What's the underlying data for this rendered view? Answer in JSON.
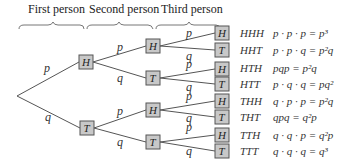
{
  "headers": [
    {
      "label": "First person"
    },
    {
      "label": "Second person"
    },
    {
      "label": "Third person"
    }
  ],
  "level1": [
    {
      "node": "H",
      "edge": "p"
    },
    {
      "node": "T",
      "edge": "q"
    }
  ],
  "level2": [
    {
      "node": "H",
      "edge": "p"
    },
    {
      "node": "T",
      "edge": "q"
    },
    {
      "node": "H",
      "edge": "p"
    },
    {
      "node": "T",
      "edge": "q"
    }
  ],
  "level3": [
    {
      "node": "H",
      "edge": "p"
    },
    {
      "node": "T",
      "edge": "q"
    },
    {
      "node": "H",
      "edge": "p"
    },
    {
      "node": "T",
      "edge": "q"
    },
    {
      "node": "H",
      "edge": "p"
    },
    {
      "node": "T",
      "edge": "q"
    },
    {
      "node": "H",
      "edge": "p"
    },
    {
      "node": "T",
      "edge": "q"
    }
  ],
  "outcomes": [
    {
      "label": "HHH",
      "formula": "p · p · p = p³"
    },
    {
      "label": "HHT",
      "formula": "p · p · q = p²q"
    },
    {
      "label": "HTH",
      "formula": "pqp = p²q"
    },
    {
      "label": "HTT",
      "formula": "p · q · q = pq²"
    },
    {
      "label": "THH",
      "formula": "q · p · p = p²q"
    },
    {
      "label": "THT",
      "formula": "qpq = q²p"
    },
    {
      "label": "TTH",
      "formula": "q · q · p = q²p"
    },
    {
      "label": "TTT",
      "formula": "q · q · q = q³"
    }
  ]
}
